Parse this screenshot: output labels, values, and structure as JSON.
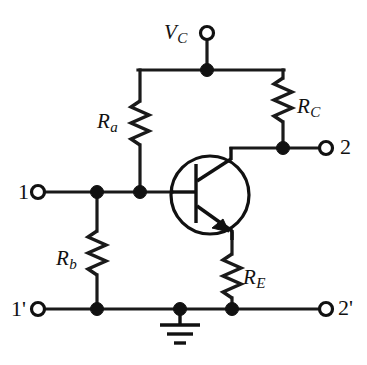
{
  "figure": {
    "type": "circuit-schematic",
    "background_color": "#ffffff",
    "line_color": "#111111"
  },
  "labels": {
    "supply": {
      "symbol": "V",
      "subscript": "C"
    },
    "resistor_a": {
      "symbol": "R",
      "subscript": "a"
    },
    "resistor_b": {
      "symbol": "R",
      "subscript": "b"
    },
    "resistor_c": {
      "symbol": "R",
      "subscript": "C"
    },
    "resistor_e": {
      "symbol": "R",
      "subscript": "E"
    }
  },
  "terminals": {
    "input_top": "1",
    "input_bottom": "1'",
    "output_top": "2",
    "output_bottom": "2'",
    "supply": "V"
  },
  "components": {
    "transistor": {
      "name": "npn-bjt",
      "type": "npn",
      "terminals": [
        "base",
        "collector",
        "emitter"
      ]
    },
    "ground": {
      "name": "ground-symbol",
      "bars": 3
    },
    "resistors": [
      {
        "name": "Ra",
        "orientation": "vertical",
        "label_side": "left"
      },
      {
        "name": "Rb",
        "orientation": "vertical",
        "label_side": "left"
      },
      {
        "name": "RC",
        "orientation": "vertical",
        "label_side": "right"
      },
      {
        "name": "RE",
        "orientation": "vertical",
        "label_side": "right"
      }
    ]
  },
  "nodes": [
    {
      "name": "supply-node",
      "x": 207,
      "y": 70
    },
    {
      "name": "base-node-left",
      "x": 97,
      "y": 192
    },
    {
      "name": "base-node-right",
      "x": 140,
      "y": 192
    },
    {
      "name": "collector-node",
      "x": 283,
      "y": 148
    },
    {
      "name": "bottom-node-left",
      "x": 97,
      "y": 309
    },
    {
      "name": "ground-node",
      "x": 180,
      "y": 309
    },
    {
      "name": "emitter-node",
      "x": 232,
      "y": 309
    }
  ]
}
